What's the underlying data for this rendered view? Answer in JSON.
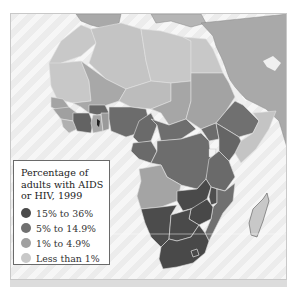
{
  "map": {
    "region": "Africa",
    "theme": "Percentage of adults with AIDS or HIV, 1999",
    "colors": {
      "sea": "#f0f0f0",
      "non_africa_land": "#a9a9a9",
      "border": "#d8d8d8"
    }
  },
  "legend": {
    "title": "Percentage of adults with AIDS or HIV, 1999",
    "title_lines": [
      "Percentage of",
      "adults with AIDS",
      "or HIV, 1999"
    ],
    "items": [
      {
        "label": "15% to 36%",
        "color": "#4a4a4a"
      },
      {
        "label": "5% to 14.9%",
        "color": "#707070"
      },
      {
        "label": "1% to 4.9%",
        "color": "#a0a0a0"
      },
      {
        "label": "Less than 1%",
        "color": "#c8c8c8"
      }
    ]
  }
}
